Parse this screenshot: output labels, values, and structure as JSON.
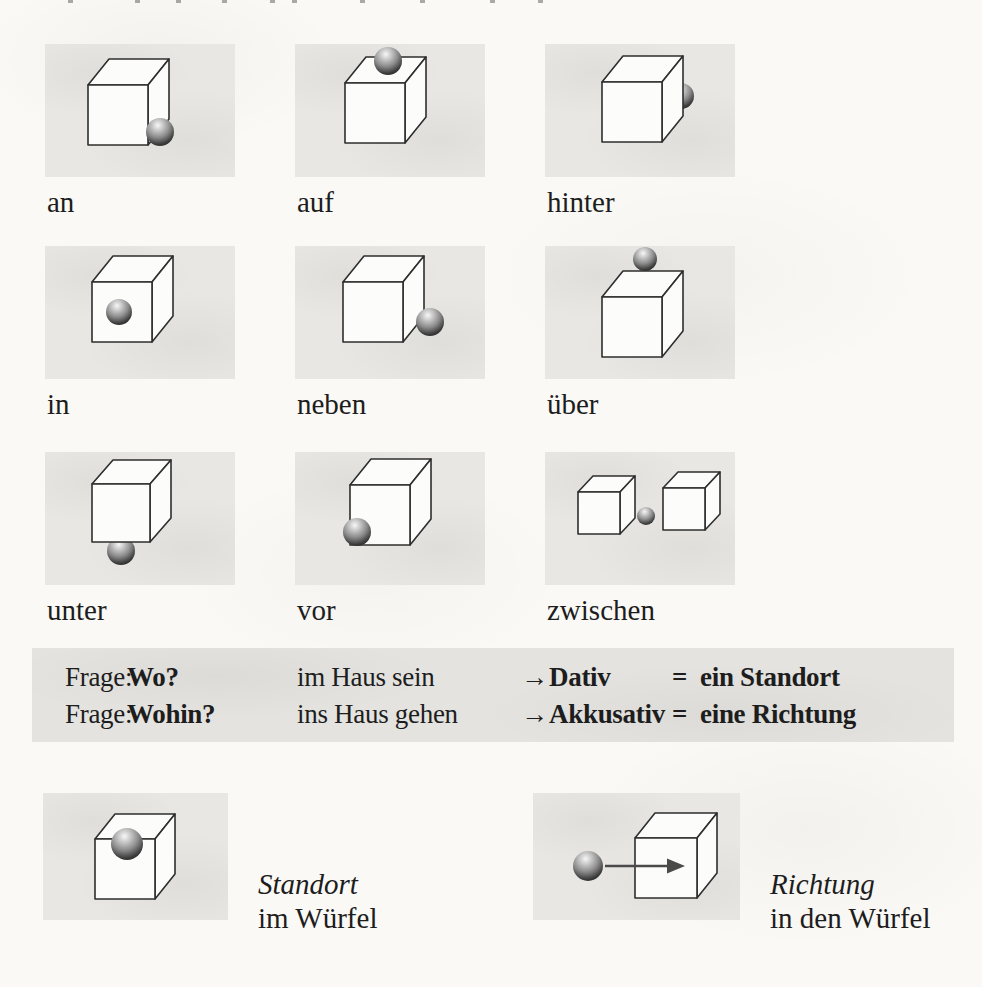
{
  "prepositions": [
    {
      "label": "an"
    },
    {
      "label": "auf"
    },
    {
      "label": "hinter"
    },
    {
      "label": "in"
    },
    {
      "label": "neben"
    },
    {
      "label": "über"
    },
    {
      "label": "unter"
    },
    {
      "label": "vor"
    },
    {
      "label": "zwischen"
    }
  ],
  "rule_table": {
    "rows": [
      {
        "prefix": "Frage:",
        "question": "Wo?",
        "example": "im Haus sein",
        "arrow": "→",
        "case": "Dativ",
        "equals": "=",
        "result": "ein Standort"
      },
      {
        "prefix": "Frage:",
        "question": "Wohin?",
        "example": "ins Haus gehen",
        "arrow": "→",
        "case": "Akkusativ",
        "equals": "=",
        "result": "eine Richtung"
      }
    ]
  },
  "examples": [
    {
      "term": "Standort",
      "phrase": "im Würfel"
    },
    {
      "term": "Richtung",
      "phrase": "in den Würfel"
    }
  ],
  "colors": {
    "page_bg": "#faf9f6",
    "patch_bg": "#e8e7e3",
    "band_bg": "#e4e3df",
    "ink": "#1d1d1d",
    "line": "#2e2e2e"
  }
}
